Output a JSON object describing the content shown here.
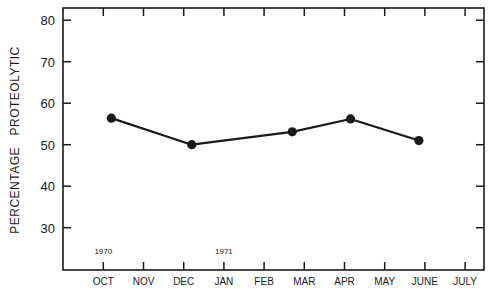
{
  "chart_data": {
    "type": "line",
    "title": "",
    "xlabel": "",
    "ylabel": "PERCENTAGE   PROTEOLYTIC",
    "ylim": [
      20,
      83
    ],
    "yticks": [
      30,
      40,
      50,
      60,
      70,
      80
    ],
    "x_ticks": [
      "OCT",
      "NOV",
      "DEC",
      "JAN",
      "FEB",
      "MAR",
      "APR",
      "MAY",
      "JUNE",
      "JULY"
    ],
    "year_annotations": [
      {
        "label": "1970",
        "at_month_index": 0
      },
      {
        "label": "1971",
        "at_month_index": 3
      }
    ],
    "grid": false,
    "legend": null,
    "series": [
      {
        "name": "Percentage proteolytic",
        "x_month_index": [
          0.2,
          2.2,
          4.7,
          6.15,
          7.85
        ],
        "x_labels_approx": [
          "early Oct 1970",
          "early Dec 1970",
          "late Feb 1971",
          "early Apr 1971",
          "late May 1971"
        ],
        "values": [
          56.4,
          50.0,
          53.1,
          56.2,
          51.0
        ]
      }
    ]
  },
  "layout": {
    "plot_left": 63,
    "plot_right": 484,
    "plot_top": 8,
    "plot_bottom": 270,
    "x0_px": 103.3,
    "month_px": 40.2,
    "y_ref_value": 50,
    "y_ref_px": 144.7,
    "px_per_unit": 4.15
  },
  "colors": {
    "line": "#1a1a1a",
    "axis": "#1a1a1a",
    "background": "#ffffff"
  }
}
